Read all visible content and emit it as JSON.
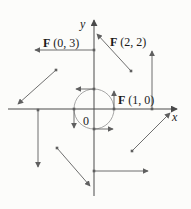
{
  "figure": {
    "type": "vector-field-diagram",
    "colors": {
      "background": "#fcfcfa",
      "axis": "#4a4a4a",
      "vector": "#5f5f5f",
      "circle": "#9c9c9c",
      "text": "#1a1a1a"
    }
  },
  "chart_data": {
    "type": "vector-field",
    "axes": {
      "x_label": "x",
      "y_label": "y",
      "origin_label": "0",
      "x_line": {
        "from": [
          8,
          109
        ],
        "to": [
          177,
          109
        ]
      },
      "y_line": {
        "from": [
          94,
          196
        ],
        "to": [
          94,
          20
        ]
      }
    },
    "unit_circle": {
      "cx": 94,
      "cy": 109,
      "r": 20
    },
    "vectors": [
      {
        "point": [
          1,
          0
        ],
        "value": [
          0,
          1
        ],
        "from": [
          114,
          109
        ],
        "to": [
          114,
          91
        ]
      },
      {
        "point": [
          0,
          1
        ],
        "value": [
          -1,
          0
        ],
        "from": [
          94,
          89
        ],
        "to": [
          76,
          89
        ]
      },
      {
        "point": [
          -1,
          0
        ],
        "value": [
          0,
          -1
        ],
        "from": [
          74,
          109
        ],
        "to": [
          74,
          128
        ]
      },
      {
        "point": [
          0,
          -1
        ],
        "value": [
          1,
          0
        ],
        "from": [
          94,
          129
        ],
        "to": [
          113,
          129
        ]
      },
      {
        "point": [
          0,
          3
        ],
        "value": [
          -3,
          0
        ],
        "from": [
          94,
          50
        ],
        "to": [
          35,
          50
        ]
      },
      {
        "point": [
          2,
          2
        ],
        "value": [
          -2,
          2
        ],
        "from": [
          131,
          71
        ],
        "to": [
          97,
          34
        ]
      },
      {
        "point": [
          3,
          0
        ],
        "value": [
          0,
          3
        ],
        "from": [
          152,
          109
        ],
        "to": [
          152,
          51
        ]
      },
      {
        "point": [
          -2,
          2
        ],
        "value": [
          -2,
          -2
        ],
        "from": [
          56,
          70
        ],
        "to": [
          18,
          104
        ]
      },
      {
        "point": [
          -3,
          0
        ],
        "value": [
          0,
          -3
        ],
        "from": [
          38,
          110
        ],
        "to": [
          38,
          167
        ]
      },
      {
        "point": [
          -2,
          -2
        ],
        "value": [
          2,
          -2
        ],
        "from": [
          57,
          148
        ],
        "to": [
          90,
          186
        ]
      },
      {
        "point": [
          0,
          -3
        ],
        "value": [
          3,
          0
        ],
        "from": [
          94,
          171
        ],
        "to": [
          148,
          171
        ]
      },
      {
        "point": [
          2,
          -2
        ],
        "value": [
          2,
          2
        ],
        "from": [
          132,
          151
        ],
        "to": [
          170,
          113
        ]
      }
    ],
    "labels": [
      {
        "bold": "F",
        "rest": " (0, 3)",
        "x": 43,
        "y": 47
      },
      {
        "bold": "F",
        "rest": " (2, 2)",
        "x": 110,
        "y": 46
      },
      {
        "bold": "F",
        "rest": " (1, 0)",
        "x": 118,
        "y": 104
      }
    ]
  }
}
